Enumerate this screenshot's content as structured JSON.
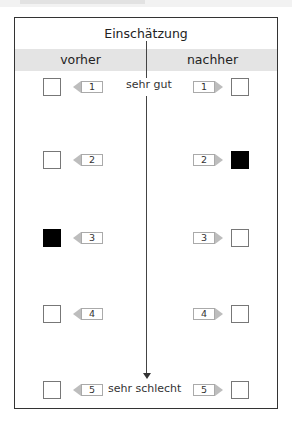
{
  "page": {
    "cut_header_text": ""
  },
  "table": {
    "title": "Einschätzung",
    "column_left": "vorher",
    "column_right": "nachher",
    "scale_top_label": "sehr gut",
    "scale_bottom_label": "sehr schlecht",
    "rows": [
      {
        "number": "1",
        "before_checked": false,
        "after_checked": false
      },
      {
        "number": "2",
        "before_checked": false,
        "after_checked": true
      },
      {
        "number": "3",
        "before_checked": true,
        "after_checked": false
      },
      {
        "number": "4",
        "before_checked": false,
        "after_checked": false
      },
      {
        "number": "5",
        "before_checked": false,
        "after_checked": false
      }
    ]
  },
  "colors": {
    "header_band": "#e4e4e4",
    "border": "#333333",
    "checked": "#000000"
  }
}
